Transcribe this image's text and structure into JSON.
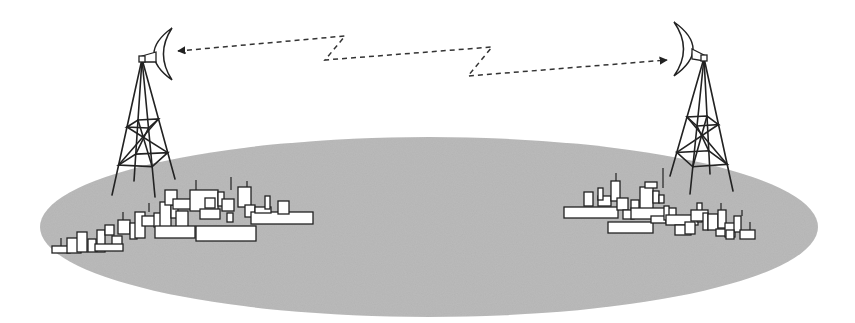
{
  "diagram": {
    "title": "",
    "canvas": {
      "width": 855,
      "height": 323,
      "background": "#ffffff"
    },
    "colors": {
      "ground": "#b4b4b4",
      "stroke": "#222222",
      "building_fill": "#ffffff",
      "link": "#333333"
    },
    "ground": {
      "cx": 429,
      "cy": 227,
      "rx": 389,
      "ry": 90
    },
    "towers": [
      {
        "id": "left",
        "apex": [
          142,
          59
        ],
        "legs": [
          [
            112,
            195
          ],
          [
            134,
            181
          ],
          [
            155,
            197
          ],
          [
            175,
            179
          ]
        ],
        "upper_band_y_frac": 0.5,
        "lower_band_y_frac": 0.78,
        "dish": {
          "top": [
            172,
            28
          ],
          "bottom": [
            172,
            80
          ],
          "bulge_x": 153,
          "inner_x": 163,
          "arm_to": [
            156,
            56
          ],
          "facing": "right"
        }
      },
      {
        "id": "right",
        "apex": [
          704,
          58
        ],
        "legs": [
          [
            670,
            176
          ],
          [
            690,
            194
          ],
          [
            710,
            174
          ],
          [
            733,
            191
          ]
        ],
        "upper_band_y_frac": 0.5,
        "lower_band_y_frac": 0.8,
        "dish": {
          "top": [
            674,
            22
          ],
          "bottom": [
            674,
            76
          ],
          "bulge_x": 694,
          "inner_x": 684,
          "arm_to": [
            692,
            53
          ],
          "facing": "left"
        }
      }
    ],
    "link": {
      "style": "dashed",
      "bidirectional": true,
      "path": [
        [
          178,
          51
        ],
        [
          345,
          36
        ],
        [
          325,
          60
        ],
        [
          492,
          47
        ],
        [
          468,
          76
        ],
        [
          667,
          60
        ]
      ]
    },
    "cities": [
      {
        "id": "left-city",
        "buildings": [
          [
            52,
            246,
            18,
            7
          ],
          [
            67,
            238,
            14,
            15
          ],
          [
            77,
            232,
            10,
            20
          ],
          [
            88,
            239,
            8,
            13
          ],
          [
            97,
            230,
            8,
            22
          ],
          [
            105,
            225,
            9,
            10
          ],
          [
            112,
            236,
            10,
            14
          ],
          [
            118,
            220,
            12,
            14
          ],
          [
            95,
            244,
            28,
            7
          ],
          [
            130,
            223,
            7,
            16
          ],
          [
            135,
            212,
            10,
            26
          ],
          [
            142,
            216,
            14,
            10
          ],
          [
            154,
            213,
            8,
            14
          ],
          [
            160,
            202,
            11,
            25
          ],
          [
            171,
            205,
            7,
            13
          ],
          [
            176,
            211,
            12,
            22
          ],
          [
            155,
            226,
            40,
            12
          ],
          [
            165,
            190,
            12,
            15
          ],
          [
            173,
            199,
            38,
            10
          ],
          [
            190,
            190,
            28,
            21
          ],
          [
            200,
            209,
            20,
            10
          ],
          [
            205,
            198,
            10,
            10
          ],
          [
            218,
            192,
            6,
            14
          ],
          [
            222,
            199,
            12,
            12
          ],
          [
            227,
            213,
            6,
            9
          ],
          [
            196,
            226,
            60,
            15
          ],
          [
            238,
            187,
            13,
            20
          ],
          [
            245,
            205,
            10,
            12
          ],
          [
            251,
            212,
            62,
            12
          ],
          [
            255,
            207,
            16,
            6
          ],
          [
            265,
            196,
            5,
            13
          ],
          [
            278,
            201,
            11,
            13
          ]
        ],
        "antennas": [
          [
            61,
            238,
            246
          ],
          [
            123,
            212,
            220
          ],
          [
            149,
            203,
            212
          ],
          [
            231,
            177,
            190
          ],
          [
            247,
            181,
            187
          ],
          [
            196,
            180,
            192
          ]
        ]
      },
      {
        "id": "right-city",
        "buildings": [
          [
            564,
            207,
            54,
            11
          ],
          [
            584,
            192,
            9,
            14
          ],
          [
            598,
            196,
            13,
            10
          ],
          [
            598,
            188,
            5,
            12
          ],
          [
            611,
            181,
            9,
            20
          ],
          [
            617,
            198,
            11,
            12
          ],
          [
            623,
            210,
            11,
            9
          ],
          [
            631,
            200,
            8,
            10
          ],
          [
            640,
            187,
            13,
            22
          ],
          [
            645,
            182,
            12,
            6
          ],
          [
            653,
            191,
            6,
            12
          ],
          [
            659,
            195,
            5,
            8
          ],
          [
            631,
            208,
            45,
            11
          ],
          [
            608,
            222,
            45,
            11
          ],
          [
            651,
            216,
            15,
            7
          ],
          [
            664,
            206,
            5,
            14
          ],
          [
            666,
            215,
            32,
            10
          ],
          [
            675,
            225,
            16,
            10
          ],
          [
            685,
            222,
            10,
            12
          ],
          [
            697,
            203,
            5,
            19
          ],
          [
            691,
            210,
            17,
            11
          ],
          [
            703,
            213,
            5,
            17
          ],
          [
            708,
            214,
            10,
            16
          ],
          [
            718,
            210,
            8,
            18
          ],
          [
            716,
            229,
            14,
            7
          ],
          [
            725,
            223,
            10,
            14
          ],
          [
            734,
            216,
            7,
            16
          ],
          [
            740,
            230,
            15,
            9
          ],
          [
            726,
            230,
            8,
            9
          ]
        ],
        "antennas": [
          [
            616,
            173,
            181
          ],
          [
            663,
            168,
            188
          ],
          [
            721,
            203,
            210
          ],
          [
            742,
            210,
            216
          ],
          [
            750,
            222,
            230
          ]
        ]
      }
    ]
  }
}
